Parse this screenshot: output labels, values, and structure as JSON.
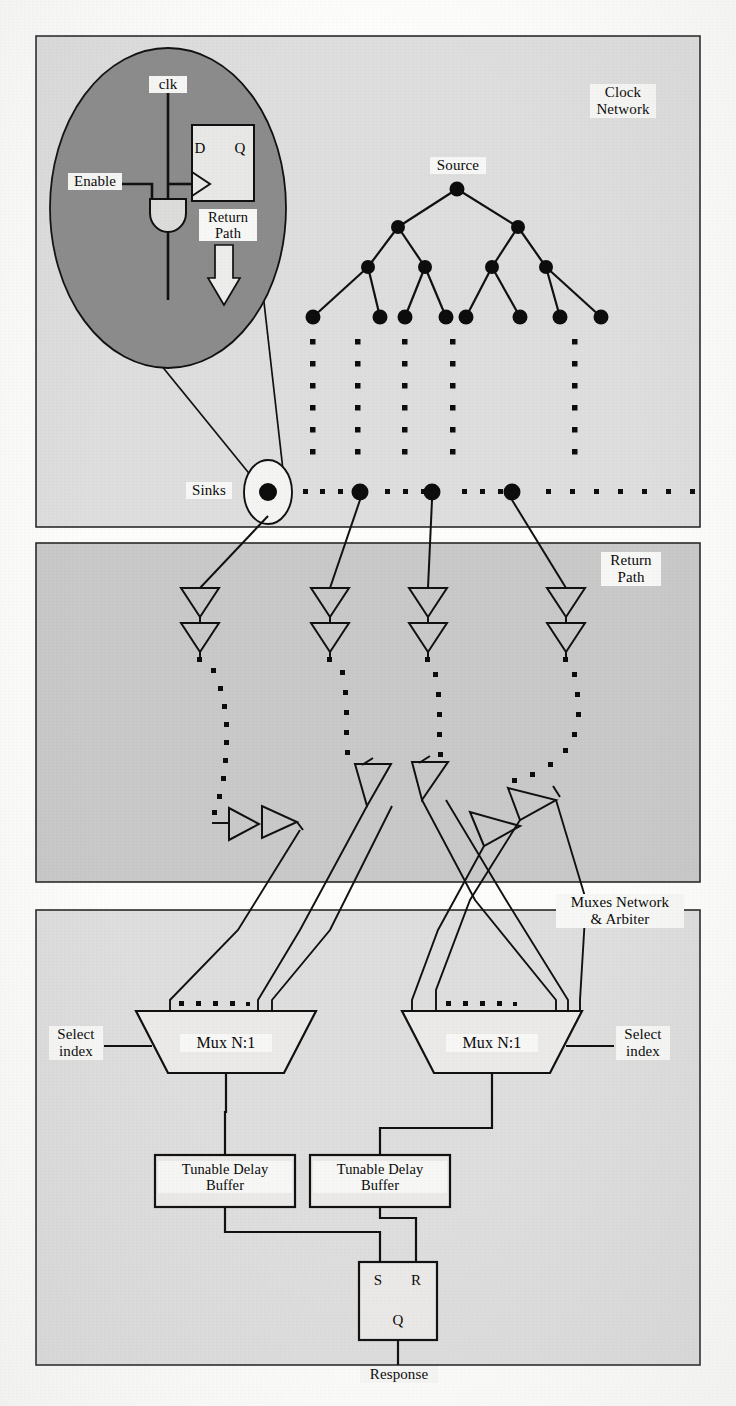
{
  "figure": {
    "colors": {
      "page_background": "#fdfdfc",
      "panel_light": "#dedede",
      "panel_mid": "#c9c9c9",
      "panel_border": "#2a2a2a",
      "inset_fill": "#8c8c8c",
      "line": "#111111",
      "label_background": "#f7f7f5",
      "text": "#0a0a0a",
      "white_fill": "#f2f2f0"
    }
  },
  "panels": [
    {
      "id": "clock-network",
      "label": "Clock\nNetwork",
      "label_x": 604,
      "label_y": 88
    },
    {
      "id": "return-path",
      "label": "Return\nPath",
      "label_x": 612,
      "label_y": 557
    },
    {
      "id": "muxes-arbiter",
      "label": "Muxes Network\n& Arbiter",
      "label_x": 597,
      "label_y": 900
    }
  ],
  "inset": {
    "name": "sink-detail-ellipse",
    "clk_label": "clk",
    "enable_label": "Enable",
    "return_path_label": "Return\nPath",
    "flipflop": {
      "d_label": "D",
      "q_label": "Q"
    }
  },
  "clock_tree": {
    "source_label": "Source",
    "levels": 4,
    "fanout": 2,
    "node_counts": [
      1,
      2,
      4,
      8
    ],
    "source_node": {
      "x": 457,
      "y": 189
    },
    "level2_nodes": [
      {
        "x": 398,
        "y": 227
      },
      {
        "x": 518,
        "y": 227
      }
    ],
    "level3_nodes": [
      {
        "x": 368,
        "y": 267
      },
      {
        "x": 425,
        "y": 267
      },
      {
        "x": 492,
        "y": 267
      },
      {
        "x": 546,
        "y": 267
      }
    ],
    "leaf_nodes": [
      {
        "x": 313,
        "y": 317
      },
      {
        "x": 380,
        "y": 317
      },
      {
        "x": 405,
        "y": 317
      },
      {
        "x": 446,
        "y": 317
      },
      {
        "x": 466,
        "y": 317
      },
      {
        "x": 520,
        "y": 317
      },
      {
        "x": 560,
        "y": 317
      },
      {
        "x": 601,
        "y": 317
      }
    ],
    "dot_columns_x": [
      313,
      358,
      405,
      466,
      575
    ],
    "dot_column_ys": [
      342,
      364,
      386,
      408,
      430,
      452
    ]
  },
  "sinks": {
    "label": "Sinks",
    "label_x": 190,
    "label_y": 484,
    "row_y": 492,
    "highlighted_sink_x": 268,
    "major_sinks_x": [
      268,
      360,
      432,
      512
    ],
    "minor_dots_x": [
      305,
      322,
      340,
      387,
      405,
      423,
      464,
      482,
      500,
      548,
      572,
      596,
      620,
      644,
      668,
      692,
      714
    ]
  },
  "return_path": {
    "buffer_columns_x": [
      200,
      330,
      428,
      566
    ],
    "buffer_rows_y": [
      598,
      632
    ],
    "dot_trail_label": "dotted return wire",
    "angled_buffers": 6,
    "stage_label": "Return Path"
  },
  "muxes": [
    {
      "name": "mux-left",
      "label": "Mux N:1",
      "select_label": "Select\nindex",
      "select_side": "left",
      "cx": 226,
      "top_y": 1011,
      "bottom_y": 1073,
      "top_half_width": 90,
      "bottom_half_width": 58,
      "ellipsis_dots": 5
    },
    {
      "name": "mux-right",
      "label": "Mux N:1",
      "select_label": "Select\nindex",
      "select_side": "right",
      "cx": 492,
      "top_y": 1011,
      "bottom_y": 1073,
      "top_half_width": 90,
      "bottom_half_width": 58,
      "ellipsis_dots": 5
    }
  ],
  "tunable_delay_buffers": [
    {
      "name": "tunable-delay-buffer-left",
      "label": "Tunable Delay\nBuffer",
      "x": 155,
      "y": 1155,
      "w": 140,
      "h": 52
    },
    {
      "name": "tunable-delay-buffer-right",
      "label": "Tunable Delay\nBuffer",
      "x": 310,
      "y": 1155,
      "w": 140,
      "h": 52
    },
    {
      "name": "tunable-delay-buffer-left-pos",
      "note": "left box"
    },
    {
      "name": "tunable-delay-buffer-right-pos",
      "note": "right box"
    }
  ],
  "arbiter": {
    "name": "sr-latch",
    "s_label": "S",
    "r_label": "R",
    "q_label": "Q",
    "output_label": "Response",
    "box": {
      "x": 359,
      "y": 1262,
      "w": 78,
      "h": 78
    }
  }
}
